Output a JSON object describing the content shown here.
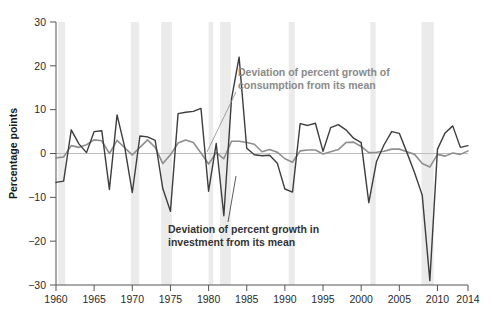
{
  "chart_data": {
    "type": "line",
    "title": "",
    "subtitle": "",
    "xlabel": "",
    "ylabel": "Percentage points",
    "xlim": [
      1960,
      2014
    ],
    "ylim": [
      -30,
      30
    ],
    "grid": false,
    "legend_position": "inline-annotations",
    "zero_line": 0,
    "x_ticks": [
      1960,
      1965,
      1970,
      1975,
      1980,
      1985,
      1990,
      1995,
      2000,
      2005,
      2010,
      2014
    ],
    "x_tick_labels": [
      "1960",
      "1965",
      "1970",
      "1975",
      "1980",
      "1985",
      "1990",
      "1995",
      "2000",
      "2005",
      "2010",
      "2014"
    ],
    "y_ticks": [
      30,
      20,
      10,
      0,
      -10,
      -20,
      -30
    ],
    "y_tick_labels": [
      "30",
      "20",
      "10",
      "0",
      "-10",
      "-20",
      "-30"
    ],
    "x": [
      1960,
      1961,
      1962,
      1963,
      1964,
      1965,
      1966,
      1967,
      1968,
      1969,
      1970,
      1971,
      1972,
      1973,
      1974,
      1975,
      1976,
      1977,
      1978,
      1979,
      1980,
      1981,
      1982,
      1983,
      1984,
      1985,
      1986,
      1987,
      1988,
      1989,
      1990,
      1991,
      1992,
      1993,
      1994,
      1995,
      1996,
      1997,
      1998,
      1999,
      2000,
      2001,
      2002,
      2003,
      2004,
      2005,
      2006,
      2007,
      2008,
      2009,
      2010,
      2011,
      2012,
      2013,
      2014
    ],
    "series": [
      {
        "name": "Deviation of percent growth in investment from its mean",
        "color": "#3d3d3d",
        "width": 1.4,
        "values": [
          -6.6,
          -6.3,
          5.4,
          2.2,
          0.2,
          5.0,
          5.2,
          -8.2,
          8.8,
          1.5,
          -8.9,
          4.0,
          3.8,
          3.0,
          -8.0,
          -13.2,
          9.1,
          9.4,
          9.6,
          10.3,
          -8.6,
          2.3,
          -14.2,
          12.4,
          22.0,
          1.2,
          -0.3,
          -0.5,
          -0.4,
          -2.2,
          -8.1,
          -8.8,
          6.8,
          6.4,
          6.9,
          0.5,
          5.9,
          6.6,
          5.4,
          3.5,
          2.5,
          -11.2,
          -1.9,
          2.0,
          5.0,
          4.6,
          0.2,
          -4.4,
          -9.5,
          -29.0,
          1.0,
          4.7,
          6.3,
          1.4,
          1.8
        ]
      },
      {
        "name": "Deviation of percent growth of consumption from its mean",
        "color": "#8e8e8e",
        "width": 1.6,
        "values": [
          -1.0,
          -0.8,
          1.8,
          1.4,
          2.0,
          3.1,
          2.9,
          0.0,
          3.0,
          1.3,
          -0.3,
          1.4,
          3.1,
          1.4,
          -2.3,
          -0.3,
          2.4,
          3.1,
          2.5,
          0.1,
          -2.4,
          0.2,
          -1.2,
          2.8,
          2.8,
          2.5,
          2.1,
          0.4,
          0.9,
          0.3,
          -1.2,
          -2.0,
          0.6,
          0.8,
          0.8,
          -0.1,
          0.4,
          0.9,
          2.5,
          2.6,
          1.6,
          0.2,
          0.3,
          0.5,
          1.0,
          1.0,
          0.4,
          -0.2,
          -2.3,
          -3.1,
          -0.2,
          -0.6,
          0.1,
          -0.2,
          0.6
        ]
      }
    ],
    "recession_bands": [
      {
        "start": 1960.3,
        "end": 1961.2
      },
      {
        "start": 1969.8,
        "end": 1970.9
      },
      {
        "start": 1973.8,
        "end": 1975.2
      },
      {
        "start": 1980.0,
        "end": 1980.6
      },
      {
        "start": 1981.5,
        "end": 1982.9
      },
      {
        "start": 1990.5,
        "end": 1991.3
      },
      {
        "start": 2001.2,
        "end": 2001.9
      },
      {
        "start": 2007.9,
        "end": 2009.5
      }
    ],
    "band_color": "#ebebeb",
    "annotations": [
      {
        "id": "consumption-annotation",
        "line1": "Deviation of percent growth of",
        "line2": "consumption from its mean",
        "color": "#8a8a8a",
        "text_x": 238,
        "text_y": 76,
        "leader": {
          "x1": 236,
          "y1": 92,
          "x2": 207,
          "y2": 152
        }
      },
      {
        "id": "investment-annotation",
        "line1": "Deviation of percent growth in",
        "line2": "investment from its mean",
        "color": "#333333",
        "text_x": 168,
        "text_y": 233,
        "leader": {
          "x1": 228,
          "y1": 222,
          "x2": 236,
          "y2": 176
        }
      }
    ]
  },
  "axis": {
    "y_title": "Percentage points",
    "axis_color": "#555555",
    "zero_line_color": "#b9b9b9"
  }
}
